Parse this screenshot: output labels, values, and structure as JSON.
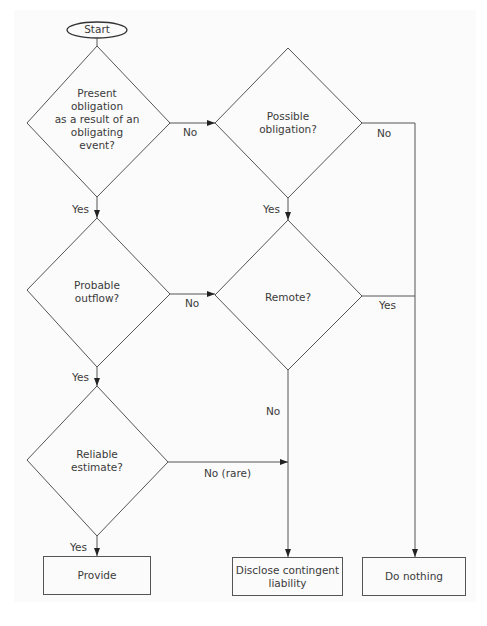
{
  "flowchart": {
    "start": {
      "label": "Start"
    },
    "decisions": [
      {
        "id": "present-obligation",
        "lines": [
          "Present",
          "obligation",
          "as a result of an",
          "obligating",
          "event?"
        ]
      },
      {
        "id": "possible-obligation",
        "lines": [
          "Possible",
          "obligation?"
        ]
      },
      {
        "id": "probable-outflow",
        "lines": [
          "Probable",
          "outflow?"
        ]
      },
      {
        "id": "remote",
        "lines": [
          "Remote?"
        ]
      },
      {
        "id": "reliable-estimate",
        "lines": [
          "Reliable",
          "estimate?"
        ]
      }
    ],
    "outcomes": [
      {
        "id": "provide",
        "label": "Provide"
      },
      {
        "id": "disclose",
        "lines": [
          "Disclose contingent",
          "liability"
        ]
      },
      {
        "id": "do-nothing",
        "label": "Do nothing"
      }
    ],
    "edges": {
      "present_no": "No",
      "present_yes": "Yes",
      "possible_no": "No",
      "possible_yes": "Yes",
      "probable_no": "No",
      "probable_yes": "Yes",
      "remote_yes": "Yes",
      "remote_no": "No",
      "reliable_no": "No (rare)",
      "reliable_yes": "Yes"
    }
  },
  "colors": {
    "line": "#555555",
    "text": "#3a3a3a",
    "background": "#fbfbfb"
  }
}
